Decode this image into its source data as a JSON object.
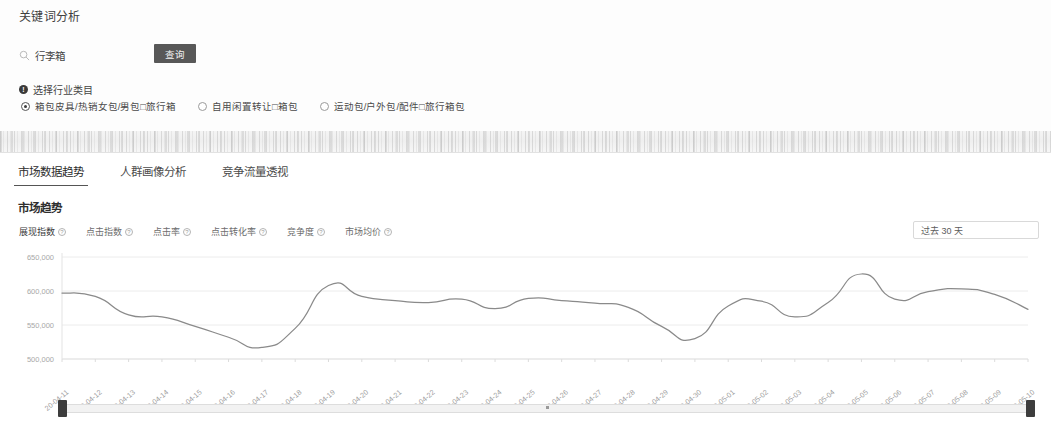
{
  "page": {
    "title": "关键词分析"
  },
  "search": {
    "icon": "search-icon",
    "value": "行李箱",
    "placeholder": "请输入关键词",
    "button_label": "查询"
  },
  "category": {
    "badge": "!",
    "label": "选择行业类目",
    "options": [
      {
        "label": "箱包皮具/热销女包/男包□旅行箱",
        "checked": true
      },
      {
        "label": "自用闲置转让□箱包",
        "checked": false
      },
      {
        "label": "运动包/户外包/配件□旅行箱包",
        "checked": false
      }
    ]
  },
  "tabs": [
    {
      "label": "市场数据趋势",
      "active": true
    },
    {
      "label": "人群画像分析",
      "active": false
    },
    {
      "label": "竞争流量透视",
      "active": false
    }
  ],
  "section": {
    "title": "市场趋势"
  },
  "metric_chips": [
    {
      "label": "展现指数",
      "help": "?",
      "active": true
    },
    {
      "label": "点击指数",
      "help": "?",
      "active": false
    },
    {
      "label": "点击率",
      "help": "?",
      "active": false
    },
    {
      "label": "点击转化率",
      "help": "?",
      "active": false
    },
    {
      "label": "竞争度",
      "help": "?",
      "active": false
    },
    {
      "label": "市场均价",
      "help": "?",
      "active": false
    }
  ],
  "range_select": {
    "value": "过去 30 天",
    "caret": "chevron-down-icon"
  },
  "chart_data": {
    "type": "line",
    "title": "市场趋势",
    "xlabel": "",
    "ylabel": "",
    "ylim": [
      500000,
      650000
    ],
    "yticks": [
      500000,
      550000,
      600000,
      650000
    ],
    "ytick_labels": [
      "500,000",
      "550,000",
      "600,000",
      "650,000"
    ],
    "grid": true,
    "legend": "none",
    "line_color": "#8a8a8a",
    "categories": [
      "20-04-11",
      "20-04-12",
      "20-04-13",
      "20-04-14",
      "20-04-15",
      "20-04-16",
      "20-04-17",
      "20-04-18",
      "20-04-19",
      "20-04-20",
      "20-04-21",
      "20-04-22",
      "20-04-23",
      "20-04-24",
      "20-04-25",
      "20-04-26",
      "20-04-27",
      "20-04-28",
      "20-04-29",
      "20-04-30",
      "20-05-01",
      "20-05-02",
      "20-05-03",
      "20-05-04",
      "20-05-05",
      "20-05-06",
      "20-05-07",
      "20-05-08",
      "20-05-09",
      "20-05-10"
    ],
    "series": [
      {
        "name": "展现指数",
        "values": [
          597000,
          592000,
          565000,
          562000,
          548000,
          532000,
          517000,
          545000,
          608000,
          592000,
          586000,
          583000,
          588000,
          574000,
          589000,
          586000,
          582000,
          576000,
          548000,
          530000,
          578000,
          585000,
          562000,
          583000,
          625000,
          588000,
          599000,
          603000,
          595000,
          573000
        ]
      }
    ]
  },
  "scrollbar": {
    "left_handle": "range-handle-left",
    "right_handle": "range-handle-right"
  }
}
